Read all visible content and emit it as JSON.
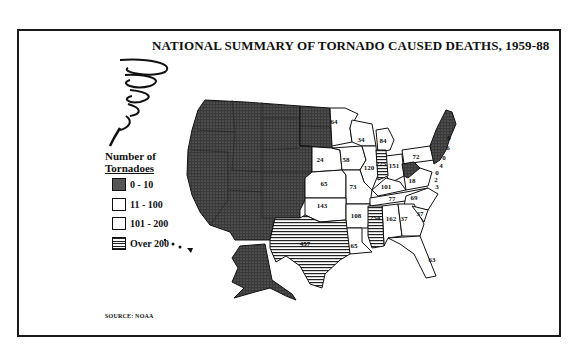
{
  "title": "NATIONAL SUMMARY OF TORNADO CAUSED DEATHS, 1959-88",
  "legend": {
    "title_line1": "Number of",
    "title_line2": "Tornadoes",
    "items": [
      {
        "label": "0 - 10",
        "pattern": "dark-stipple"
      },
      {
        "label": "11 - 100",
        "pattern": "white"
      },
      {
        "label": "101 - 200",
        "pattern": "white"
      },
      {
        "label": "Over 200",
        "pattern": "horizontal-stripes"
      }
    ]
  },
  "source": "SOURCE: NOAA",
  "icons": {
    "tornado": "tornado-funnel-icon"
  },
  "colors": {
    "dark_fill": "#3a3a3a",
    "border": "#111111",
    "background": "#ffffff"
  },
  "states": {
    "MN": "64",
    "WI": "34",
    "MI": "84",
    "NE": "24",
    "IA": "58",
    "IL": "120",
    "IN": "225",
    "OH": "151",
    "PA": "72",
    "KS": "65",
    "MO": "73",
    "KY": "101",
    "VA": "18",
    "NC": "69",
    "TN": "77",
    "OK": "143",
    "AR": "108",
    "MS": "254",
    "AL": "162",
    "GA": "37",
    "SC": "37",
    "FL": "63",
    "LA": "65",
    "TX": "457",
    "NE_small": [
      "8",
      "6",
      "0",
      "4",
      "0",
      "2",
      "3"
    ]
  }
}
